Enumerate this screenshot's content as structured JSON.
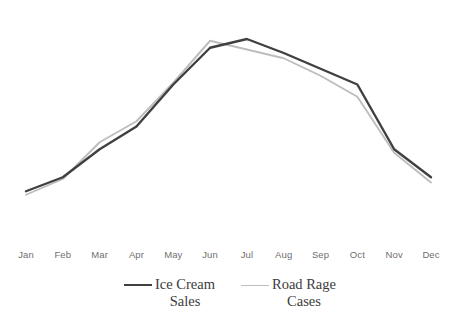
{
  "chart_data": {
    "type": "line",
    "title": "",
    "subtitle": "",
    "xlabel": "",
    "ylabel": "",
    "grid": false,
    "legend_position": "bottom",
    "axis": {
      "x_visible": false,
      "y_visible": false,
      "y_ticks_visible": false,
      "ylim": [
        0,
        100
      ]
    },
    "categories": [
      "Jan",
      "Feb",
      "Mar",
      "Apr",
      "May",
      "Jun",
      "Jul",
      "Aug",
      "Sep",
      "Oct",
      "Nov",
      "Dec"
    ],
    "series": [
      {
        "name": "Ice Cream Sales",
        "legend_label_line1": "Ice Cream",
        "legend_label_line2": "Sales",
        "color": "#404040",
        "width": 2.4,
        "values": [
          21,
          29,
          45,
          58,
          82,
          103,
          108,
          100,
          91,
          82,
          45,
          29
        ]
      },
      {
        "name": "Road Rage Cases",
        "legend_label_line1": "Road Rage",
        "legend_label_line2": "Cases",
        "color": "#bdbdbd",
        "width": 1.9,
        "values": [
          19,
          28,
          49,
          61,
          83,
          107,
          102,
          97,
          87,
          75,
          43,
          26
        ]
      }
    ]
  },
  "colors": {
    "background": "#ffffff",
    "tick_label": "#6f6f6f",
    "legend_text": "#3b3b3b",
    "series_primary": "#404040",
    "series_secondary": "#bdbdbd"
  }
}
